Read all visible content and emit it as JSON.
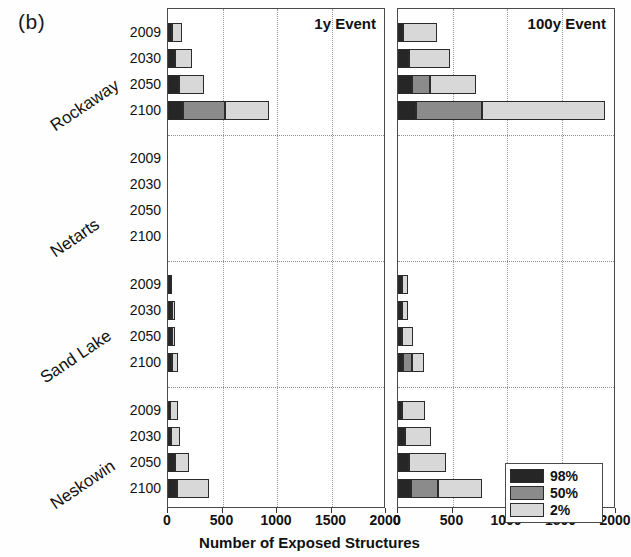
{
  "figure": {
    "panel_label": "(b)",
    "xtitle": "Number of Exposed Structures"
  },
  "legend": {
    "items": [
      {
        "label": "98%",
        "color": "#262626",
        "key": "s98"
      },
      {
        "label": "50%",
        "color": "#8b8b8b",
        "key": "s50"
      },
      {
        "label": "2%",
        "color": "#d8d8d8",
        "key": "s2"
      }
    ]
  },
  "chart_data": {
    "type": "bar",
    "orientation": "horizontal",
    "stacked": true,
    "title": "",
    "xlabel": "Number of Exposed Structures",
    "ylabel": "",
    "xlim": [
      0,
      2000
    ],
    "xticks": [
      0,
      500,
      1000,
      1500,
      2000
    ],
    "grid": "vertical-dotted",
    "legend_position": "bottom-right",
    "groups": [
      "Rockaway",
      "Netarts",
      "Sand Lake",
      "Neskowin"
    ],
    "years": [
      "2009",
      "2030",
      "2050",
      "2100"
    ],
    "series": [
      {
        "name": "98%",
        "color": "#262626"
      },
      {
        "name": "50%",
        "color": "#8b8b8b"
      },
      {
        "name": "2%",
        "color": "#d8d8d8"
      }
    ],
    "panels": [
      {
        "name": "1y Event",
        "title": "1y Event",
        "rows": [
          {
            "group": "Rockaway",
            "year": "2009",
            "values": [
              40,
              0,
              90
            ],
            "total": 130
          },
          {
            "group": "Rockaway",
            "year": "2030",
            "values": [
              65,
              0,
              155
            ],
            "total": 220
          },
          {
            "group": "Rockaway",
            "year": "2050",
            "values": [
              105,
              0,
              225
            ],
            "total": 330
          },
          {
            "group": "Rockaway",
            "year": "2100",
            "values": [
              140,
              385,
              405
            ],
            "total": 930
          },
          {
            "group": "Netarts",
            "year": "2009",
            "values": [
              0,
              0,
              0
            ],
            "total": 0
          },
          {
            "group": "Netarts",
            "year": "2030",
            "values": [
              0,
              0,
              0
            ],
            "total": 0
          },
          {
            "group": "Netarts",
            "year": "2050",
            "values": [
              0,
              0,
              0
            ],
            "total": 0
          },
          {
            "group": "Netarts",
            "year": "2100",
            "values": [
              0,
              0,
              0
            ],
            "total": 0
          },
          {
            "group": "Sand Lake",
            "year": "2009",
            "values": [
              35,
              0,
              0
            ],
            "total": 35
          },
          {
            "group": "Sand Lake",
            "year": "2030",
            "values": [
              35,
              0,
              10
            ],
            "total": 45
          },
          {
            "group": "Sand Lake",
            "year": "2050",
            "values": [
              35,
              0,
              10
            ],
            "total": 45
          },
          {
            "group": "Sand Lake",
            "year": "2100",
            "values": [
              40,
              0,
              55
            ],
            "total": 95
          },
          {
            "group": "Neskowin",
            "year": "2009",
            "values": [
              20,
              0,
              70
            ],
            "total": 90
          },
          {
            "group": "Neskowin",
            "year": "2030",
            "values": [
              30,
              0,
              80
            ],
            "total": 110
          },
          {
            "group": "Neskowin",
            "year": "2050",
            "values": [
              60,
              0,
              130
            ],
            "total": 190
          },
          {
            "group": "Neskowin",
            "year": "2100",
            "values": [
              85,
              0,
              290
            ],
            "total": 375
          }
        ]
      },
      {
        "name": "100y Event",
        "title": "100y Event",
        "rows": [
          {
            "group": "Rockaway",
            "year": "2009",
            "values": [
              50,
              0,
              310
            ],
            "total": 360
          },
          {
            "group": "Rockaway",
            "year": "2030",
            "values": [
              105,
              0,
              375
            ],
            "total": 480
          },
          {
            "group": "Rockaway",
            "year": "2050",
            "values": [
              130,
              160,
              430
            ],
            "total": 720
          },
          {
            "group": "Rockaway",
            "year": "2100",
            "values": [
              165,
              605,
              1130
            ],
            "total": 1900
          },
          {
            "group": "Netarts",
            "year": "2009",
            "values": [
              0,
              0,
              0
            ],
            "total": 0
          },
          {
            "group": "Netarts",
            "year": "2030",
            "values": [
              0,
              0,
              0
            ],
            "total": 0
          },
          {
            "group": "Netarts",
            "year": "2050",
            "values": [
              0,
              0,
              0
            ],
            "total": 0
          },
          {
            "group": "Netarts",
            "year": "2100",
            "values": [
              0,
              0,
              0
            ],
            "total": 0
          },
          {
            "group": "Sand Lake",
            "year": "2009",
            "values": [
              35,
              0,
              55
            ],
            "total": 90
          },
          {
            "group": "Sand Lake",
            "year": "2030",
            "values": [
              40,
              0,
              55
            ],
            "total": 95
          },
          {
            "group": "Sand Lake",
            "year": "2050",
            "values": [
              40,
              0,
              100
            ],
            "total": 140
          },
          {
            "group": "Sand Lake",
            "year": "2100",
            "values": [
              45,
              85,
              105
            ],
            "total": 235
          },
          {
            "group": "Neskowin",
            "year": "2009",
            "values": [
              35,
              0,
              215
            ],
            "total": 250
          },
          {
            "group": "Neskowin",
            "year": "2030",
            "values": [
              60,
              0,
              245
            ],
            "total": 305
          },
          {
            "group": "Neskowin",
            "year": "2050",
            "values": [
              100,
              0,
              340
            ],
            "total": 440
          },
          {
            "group": "Neskowin",
            "year": "2100",
            "values": [
              120,
              245,
              410
            ],
            "total": 775
          }
        ]
      }
    ]
  }
}
